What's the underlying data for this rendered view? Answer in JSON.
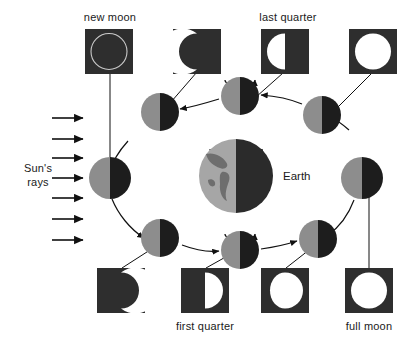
{
  "figure": {
    "title_text": "Moon phases as seen from Earth",
    "background_color": "#ffffff",
    "ink_color": "#111111"
  },
  "labels": {
    "new_moon": "new moon",
    "last_quarter": "last quarter",
    "first_quarter": "first quarter",
    "full_moon": "full moon",
    "earth": "Earth",
    "suns_rays_line1": "Sun's",
    "suns_rays_line2": "rays"
  },
  "colors": {
    "box_background": "#2e2e2e",
    "moon_lit": "#ffffff",
    "moon_dark": "#2e2e2e",
    "orbit_moon_day": "#8d8d8d",
    "orbit_moon_night": "#1d1d1d",
    "earth_day": "#a6a6a6",
    "earth_night": "#2b2b2b",
    "earth_land": "#6e6e6e",
    "new_moon_outline": "#c9c9c9",
    "line": "#111111",
    "text": "#1a1a1a"
  },
  "suns_rays": {
    "count": 7,
    "direction": "left-to-right",
    "label": "Sun's rays"
  },
  "phase_views": [
    {
      "id": "new-moon",
      "row": "top",
      "label": "new moon",
      "phase": "new",
      "illumination_percent": 0,
      "lit_side": "none",
      "box": {
        "x": 85,
        "y": 29,
        "w": 48,
        "h": 45
      }
    },
    {
      "id": "waning-crescent",
      "row": "top",
      "label": "",
      "phase": "waning crescent",
      "illumination_percent": 20,
      "lit_side": "left",
      "box": {
        "x": 173,
        "y": 29,
        "w": 48,
        "h": 45
      }
    },
    {
      "id": "last-quarter",
      "row": "top",
      "label": "last quarter",
      "phase": "last quarter",
      "illumination_percent": 50,
      "lit_side": "left",
      "box": {
        "x": 261,
        "y": 29,
        "w": 48,
        "h": 45
      }
    },
    {
      "id": "full-moon-top",
      "row": "top",
      "label": "",
      "phase": "full",
      "illumination_percent": 100,
      "lit_side": "both",
      "box": {
        "x": 349,
        "y": 29,
        "w": 48,
        "h": 45
      }
    },
    {
      "id": "waxing-crescent",
      "row": "bottom",
      "label": "",
      "phase": "waxing crescent",
      "illumination_percent": 20,
      "lit_side": "right",
      "box": {
        "x": 97,
        "y": 268,
        "w": 48,
        "h": 45
      }
    },
    {
      "id": "first-quarter",
      "row": "bottom",
      "label": "first quarter",
      "phase": "first quarter",
      "illumination_percent": 50,
      "lit_side": "right",
      "box": {
        "x": 181,
        "y": 268,
        "w": 48,
        "h": 45
      }
    },
    {
      "id": "waxing-gibbous",
      "row": "bottom",
      "label": "",
      "phase": "waxing gibbous",
      "illumination_percent": 90,
      "lit_side": "right",
      "box": {
        "x": 261,
        "y": 268,
        "w": 48,
        "h": 45
      }
    },
    {
      "id": "full-moon",
      "row": "bottom",
      "label": "full moon",
      "phase": "full",
      "illumination_percent": 100,
      "lit_side": "both",
      "box": {
        "x": 345,
        "y": 268,
        "w": 48,
        "h": 45
      }
    }
  ],
  "orbit_moons": [
    {
      "id": "orbit-moon-left",
      "angle_deg": 180,
      "cx": 110,
      "cy": 178,
      "r": 21,
      "has_rotation_arrow": false
    },
    {
      "id": "orbit-moon-upper-left",
      "angle_deg": 135,
      "cx": 160,
      "cy": 112,
      "r": 19,
      "has_rotation_arrow": false
    },
    {
      "id": "orbit-moon-top",
      "angle_deg": 90,
      "cx": 240,
      "cy": 96,
      "r": 19,
      "has_rotation_arrow": true
    },
    {
      "id": "orbit-moon-upper-right",
      "angle_deg": 45,
      "cx": 322,
      "cy": 115,
      "r": 19,
      "has_rotation_arrow": false
    },
    {
      "id": "orbit-moon-right",
      "angle_deg": 0,
      "cx": 362,
      "cy": 178,
      "r": 21,
      "has_rotation_arrow": false
    },
    {
      "id": "orbit-moon-lower-right",
      "angle_deg": 315,
      "cx": 318,
      "cy": 239,
      "r": 19,
      "has_rotation_arrow": false
    },
    {
      "id": "orbit-moon-bottom",
      "angle_deg": 270,
      "cx": 240,
      "cy": 250,
      "r": 19,
      "has_rotation_arrow": true
    },
    {
      "id": "orbit-moon-lower-left",
      "angle_deg": 225,
      "cx": 160,
      "cy": 238,
      "r": 19,
      "has_rotation_arrow": false
    }
  ],
  "earth": {
    "label": "Earth",
    "cx": 236,
    "cy": 176,
    "r": 37,
    "has_rotation_arrow": true,
    "lit_side": "left"
  },
  "orbit": {
    "cx": 236,
    "cy": 176,
    "rx": 126,
    "ry": 80,
    "direction": "counterclockwise"
  }
}
